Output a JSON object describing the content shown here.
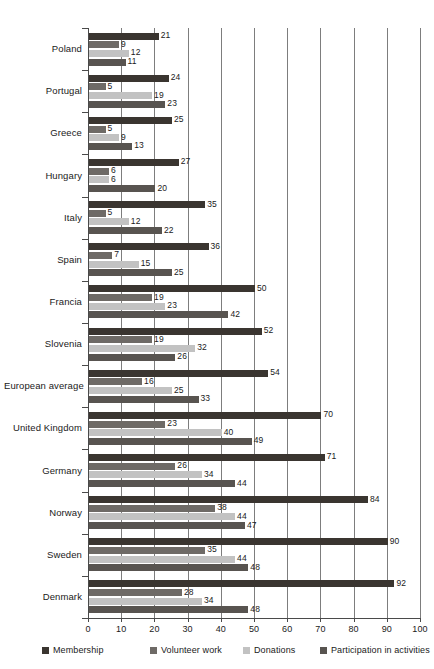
{
  "chart_data": {
    "type": "bar",
    "orientation": "horizontal",
    "title": "",
    "xlabel": "",
    "ylabel": "",
    "xlim": [
      0,
      100
    ],
    "xticks": [
      0,
      10,
      20,
      30,
      40,
      50,
      60,
      70,
      80,
      90,
      100
    ],
    "grid": true,
    "legend_position": "bottom",
    "categories": [
      "Poland",
      "Portugal",
      "Greece",
      "Hungary",
      "Italy",
      "Spain",
      "Francia",
      "Slovenia",
      "European average",
      "United Kingdom",
      "Germany",
      "Norway",
      "Sweden",
      "Denmark"
    ],
    "series": [
      {
        "name": "Membership",
        "color": "#3a3530",
        "values": [
          21,
          24,
          25,
          27,
          35,
          36,
          50,
          52,
          54,
          70,
          71,
          84,
          90,
          92
        ]
      },
      {
        "name": "Volunteer work",
        "color": "#6e6a66",
        "values": [
          9,
          5,
          5,
          6,
          5,
          7,
          19,
          19,
          16,
          23,
          26,
          38,
          35,
          28
        ]
      },
      {
        "name": "Donations",
        "color": "#c2c2c2",
        "values": [
          12,
          19,
          9,
          6,
          12,
          15,
          23,
          32,
          25,
          40,
          34,
          44,
          44,
          34
        ]
      },
      {
        "name": "Participation in activities",
        "color": "#585450",
        "values": [
          11,
          23,
          13,
          20,
          22,
          25,
          42,
          26,
          33,
          49,
          44,
          47,
          48,
          48
        ]
      }
    ]
  },
  "legend": {
    "items": [
      {
        "label": "Membership"
      },
      {
        "label": "Volunteer work"
      },
      {
        "label": "Donations"
      },
      {
        "label": "Participation in activities"
      }
    ]
  }
}
